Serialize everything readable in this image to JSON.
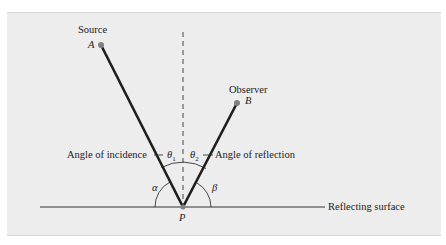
{
  "diagram": {
    "labels": {
      "source": "Source",
      "point_a": "A",
      "observer": "Observer",
      "point_b": "B",
      "angle_incidence": "Angle of incidence",
      "angle_reflection": "Angle of reflection",
      "theta1": "θ",
      "theta1_sub": "1",
      "theta2": "θ",
      "theta2_sub": "2",
      "alpha": "α",
      "beta": "β",
      "point_p": "P",
      "surface": "Reflecting surface"
    },
    "colors": {
      "background": "#ededed",
      "ray": "#1e1e1e",
      "point": "#808080",
      "line": "#333333"
    },
    "points": {
      "A": [
        101,
        45
      ],
      "B": [
        237,
        103
      ],
      "P": [
        183,
        207
      ]
    }
  }
}
